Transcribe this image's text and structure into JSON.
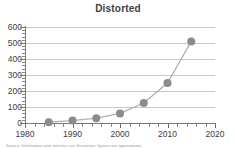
{
  "chart_data": {
    "type": "line",
    "title": "Distorted",
    "xlabel": "",
    "ylabel": "",
    "x": [
      1985,
      1990,
      1995,
      2000,
      2005,
      2010,
      2015
    ],
    "values": [
      5,
      15,
      30,
      60,
      125,
      250,
      510
    ],
    "series": [
      {
        "name": "Distorted",
        "values": [
          5,
          15,
          30,
          60,
          125,
          250,
          510
        ]
      }
    ],
    "xlim": [
      1980,
      2020
    ],
    "ylim": [
      0,
      600
    ],
    "xticks": [
      1980,
      1990,
      2000,
      2010,
      2020
    ],
    "yticks": [
      0,
      100,
      200,
      300,
      400,
      500,
      600
    ],
    "xtick_labels": [
      "1980",
      "1990",
      "2000",
      "2010",
      "2020"
    ],
    "ytick_labels": [
      "0",
      "100",
      "200",
      "300",
      "400",
      "500",
      "600"
    ],
    "x_minor_tick_step": 2,
    "y_minor_tick_step": 20,
    "grid": true,
    "grid_axis": "y",
    "legend": false,
    "marker": "circle",
    "marker_color": "#8c8c8c",
    "line_color": "#b0b0b0",
    "grid_color": "#c9c9c9",
    "axis_color": "#7a7a7a",
    "title_color": "#404040",
    "background": "#ffffff"
  },
  "footnote": {
    "text": "Source: Information and statistics are illustrative; figures are approximate."
  }
}
